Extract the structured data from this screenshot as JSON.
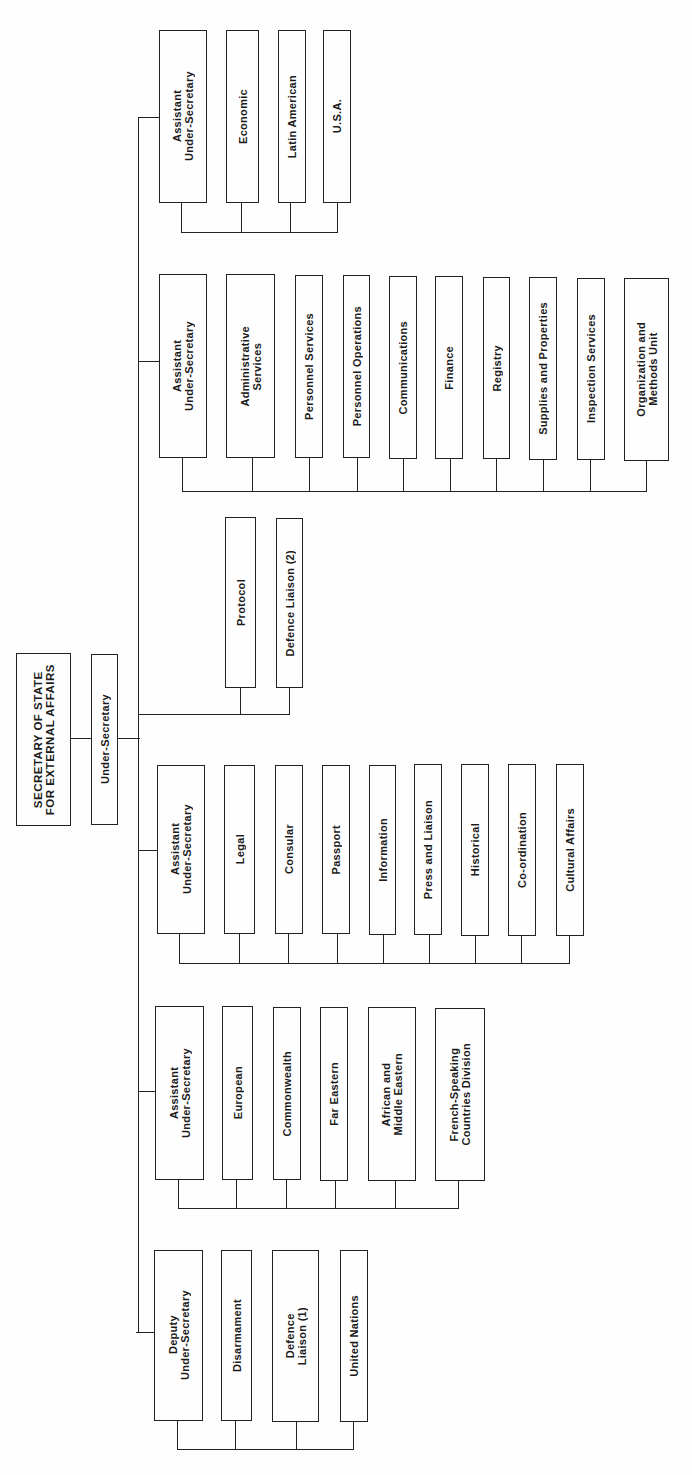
{
  "orientation": "rotated 90° counter-clockwise (labels read bottom-to-top)",
  "root": {
    "label": "SECRETARY OF STATE\nFOR EXTERNAL AFFAIRS"
  },
  "under_secretary": {
    "label": "Under-Secretary"
  },
  "groups": [
    {
      "head": "Assistant\nUnder-Secretary",
      "units": [
        "Economic",
        "Latin American",
        "U.S.A."
      ]
    },
    {
      "head": "Assistant\nUnder-Secretary",
      "units": [
        "Administrative\nServices",
        "Personnel Services",
        "Personnel Operations",
        "Communications",
        "Finance",
        "Registry",
        "Supplies and Properties",
        "Inspection Services",
        "Organization and\nMethods Unit"
      ]
    },
    {
      "head": null,
      "units": [
        "Protocol",
        "Defence Liaison (2)"
      ]
    },
    {
      "head": "Assistant\nUnder-Secretary",
      "units": [
        "Legal",
        "Consular",
        "Passport",
        "Information",
        "Press and Liaison",
        "Historical",
        "Co-ordination",
        "Cultural Affairs"
      ]
    },
    {
      "head": "Assistant\nUnder-Secretary",
      "units": [
        "European",
        "Commonwealth",
        "Far Eastern",
        "African and\nMiddle Eastern",
        "French-Speaking\nCountries Division"
      ]
    },
    {
      "head": "Deputy\nUnder-Secretary",
      "units": [
        "Disarmament",
        "Defence\nLiaison (1)",
        "United Nations"
      ]
    }
  ],
  "colors": {
    "line": "#222222",
    "background": "#fdfdfd",
    "text": "#1a1a1a"
  }
}
